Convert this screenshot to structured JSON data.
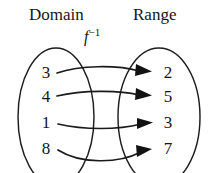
{
  "figure": {
    "type": "function-mapping-diagram",
    "width": 212,
    "height": 173,
    "background_color": "#ffffff",
    "line_color": "#1a1a1a"
  },
  "headers": {
    "domain": "Domain",
    "range": "Range"
  },
  "function_label": {
    "base": "f",
    "exponent": "−1",
    "full": "f⁻¹"
  },
  "sets": {
    "domain_values": [
      "3",
      "4",
      "1",
      "8"
    ],
    "range_values": [
      "2",
      "5",
      "3",
      "7"
    ]
  },
  "mappings": [
    {
      "from": "3",
      "to": "2"
    },
    {
      "from": "4",
      "to": "5"
    },
    {
      "from": "1",
      "to": "3"
    },
    {
      "from": "8",
      "to": "7"
    }
  ]
}
